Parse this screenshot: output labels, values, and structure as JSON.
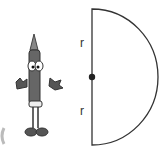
{
  "diagram": {
    "type": "semicircle",
    "labels": {
      "upper_radius": "r",
      "lower_radius": "r"
    },
    "center_dot": true,
    "colors": {
      "stroke": "#333333",
      "crayon_body": "#555555"
    }
  }
}
